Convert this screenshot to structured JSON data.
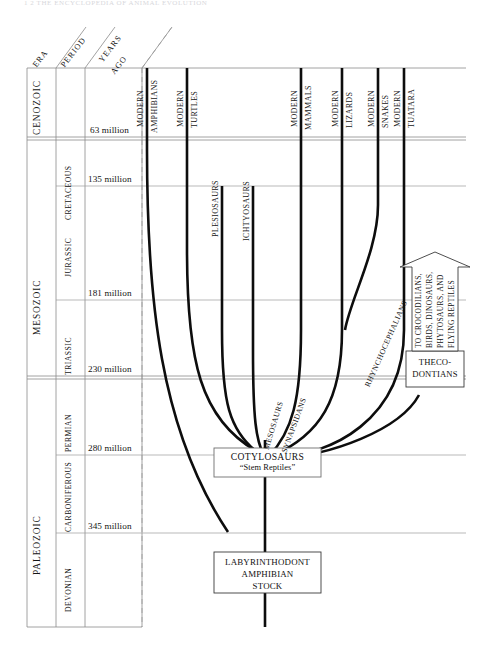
{
  "page": {
    "running_head": "1 2   THE  ENCYCLOPEDIA  OF  ANIMAL  EVOLUTION"
  },
  "columns": {
    "era_header": "ERA",
    "period_header": "PERIOD",
    "years_header_line1": "YEARS",
    "years_header_line2": "AGO"
  },
  "eras": [
    {
      "name": "CENOZOIC"
    },
    {
      "name": "MESOZOIC"
    },
    {
      "name": "PALEOZOIC"
    }
  ],
  "periods": [
    {
      "name": "CRETACEOUS"
    },
    {
      "name": "JURASSIC"
    },
    {
      "name": "TRIASSIC"
    },
    {
      "name": "PERMIAN"
    },
    {
      "name": "CARBONIFEROUS"
    },
    {
      "name": "DEVONIAN"
    }
  ],
  "year_markers": [
    {
      "label": "63 million"
    },
    {
      "label": "135 million"
    },
    {
      "label": "181 million"
    },
    {
      "label": "230 million"
    },
    {
      "label": "280 million"
    },
    {
      "label": "345 million"
    }
  ],
  "top_lineage_labels": [
    {
      "modern": "MODERN",
      "taxon": "AMPHIBIANS"
    },
    {
      "modern": "MODERN",
      "taxon": "TURTLES"
    },
    {
      "modern": "",
      "taxon": "PLESIOSAURS"
    },
    {
      "modern": "",
      "taxon": "ICHTYOSAURS"
    },
    {
      "modern": "MODERN",
      "taxon": "MAMMALS"
    },
    {
      "modern": "MODERN",
      "taxon": "LIZARDS"
    },
    {
      "modern": "MODERN",
      "taxon": "SNAKES"
    },
    {
      "modern": "MODERN",
      "taxon": "TUATARA"
    }
  ],
  "curve_labels": [
    {
      "text": "MESOSAURS"
    },
    {
      "text": "SYNAPSIDANS"
    },
    {
      "text": "RHYNCHOCEPHALIANS"
    }
  ],
  "boxes": {
    "cotylosaurs": {
      "line1": "COTYLOSAURS",
      "line2": "“Stem Reptiles”"
    },
    "labyrinthodont": {
      "line1": "LABYRINTHODONT",
      "line2": "AMPHIBIAN",
      "line3": "STOCK"
    },
    "thecodontians": {
      "line1": "THECO-",
      "line2": "DONTIANS"
    }
  },
  "arrow": {
    "line1": "TO CROCODILIANS,",
    "line2": "BIRDS, DINOSAURS,",
    "line3": "PHYTOSAURS, AND",
    "line4": "FLYING REPTILES"
  },
  "colors": {
    "ink": "#151515",
    "rule": "#8a8a8a",
    "lineage": "#0d0d0d",
    "paper": "#ffffff"
  }
}
